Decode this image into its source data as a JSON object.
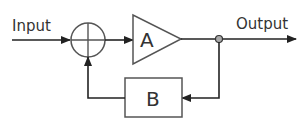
{
  "diagram": {
    "type": "feedback-loop block diagram",
    "input_label": "Input",
    "output_label": "Output",
    "amplifier_label": "A",
    "feedback_block_label": "B",
    "colors": {
      "line": "#222222",
      "block_stroke": "#555555",
      "text": "#333333",
      "junction_fill": "#aaaaaa"
    }
  }
}
